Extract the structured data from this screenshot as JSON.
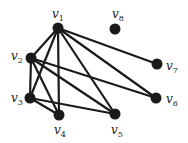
{
  "graph": {
    "nodes": [
      {
        "id": "v1",
        "name": "v",
        "sub": "1",
        "x": 58,
        "y": 28,
        "lx": 52,
        "ly": 8
      },
      {
        "id": "v2",
        "name": "v",
        "sub": "2",
        "x": 31,
        "y": 58,
        "lx": 11,
        "ly": 50
      },
      {
        "id": "v3",
        "name": "v",
        "sub": "3",
        "x": 30,
        "y": 98,
        "lx": 11,
        "ly": 92
      },
      {
        "id": "v4",
        "name": "v",
        "sub": "4",
        "x": 59,
        "y": 115,
        "lx": 54,
        "ly": 124
      },
      {
        "id": "v5",
        "name": "v",
        "sub": "5",
        "x": 115,
        "y": 114,
        "lx": 111,
        "ly": 124
      },
      {
        "id": "v6",
        "name": "v",
        "sub": "6",
        "x": 156,
        "y": 98,
        "lx": 166,
        "ly": 93
      },
      {
        "id": "v7",
        "name": "v",
        "sub": "7",
        "x": 157,
        "y": 64,
        "lx": 166,
        "ly": 60
      },
      {
        "id": "v8",
        "name": "v",
        "sub": "8",
        "x": 115,
        "y": 29,
        "lx": 112,
        "ly": 8
      }
    ],
    "edges": [
      [
        "v1",
        "v2"
      ],
      [
        "v1",
        "v3"
      ],
      [
        "v1",
        "v4"
      ],
      [
        "v1",
        "v5"
      ],
      [
        "v1",
        "v6"
      ],
      [
        "v1",
        "v7"
      ],
      [
        "v2",
        "v3"
      ],
      [
        "v2",
        "v4"
      ],
      [
        "v2",
        "v5"
      ],
      [
        "v2",
        "v6"
      ],
      [
        "v3",
        "v4"
      ],
      [
        "v3",
        "v5"
      ]
    ],
    "colors": {
      "node": "#1a1a1a",
      "edge": "#1a1a1a"
    }
  }
}
